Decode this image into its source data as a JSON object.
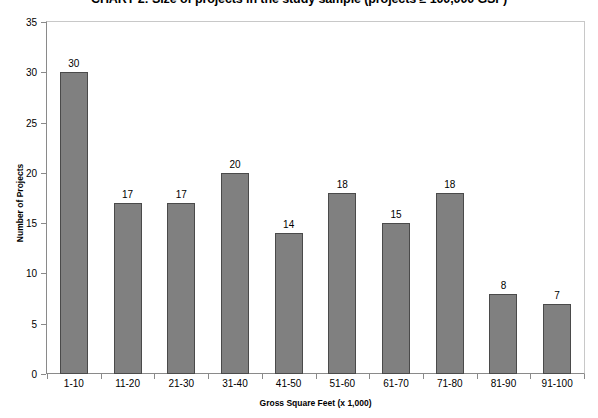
{
  "chart_data": {
    "type": "bar",
    "title": "CHART 2: Size of projects in the study sample (projects ≥ 100,000 GSF)",
    "xlabel": "Gross Square Feet (x 1,000)",
    "ylabel": "Number of Projects",
    "categories": [
      "1-10",
      "11-20",
      "21-30",
      "31-40",
      "41-50",
      "51-60",
      "61-70",
      "71-80",
      "81-90",
      "91-100"
    ],
    "values": [
      30,
      17,
      17,
      20,
      14,
      18,
      15,
      18,
      8,
      7
    ],
    "data_labels": [
      "30",
      "17",
      "17",
      "20",
      "14",
      "18",
      "15",
      "18",
      "8",
      "7"
    ],
    "ylim": [
      0,
      35
    ],
    "ytick_labels": [
      "0",
      "5",
      "10",
      "15",
      "20",
      "25",
      "30",
      "35"
    ],
    "ytick_values": [
      0,
      5,
      10,
      15,
      20,
      25,
      30,
      35
    ],
    "grid": false,
    "legend": null,
    "bar_color": "#808080",
    "bar_border_color": "#4a4a4a",
    "axis_color": "#8a8a8a",
    "plot_border_color": "#c8c8c8",
    "text_color": "#000000"
  }
}
